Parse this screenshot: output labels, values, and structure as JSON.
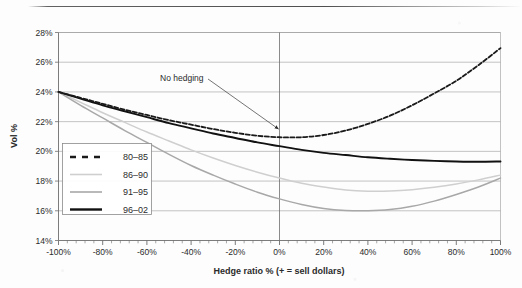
{
  "chart_data": {
    "type": "line",
    "title": "",
    "subtitle": "",
    "xlabel": "Hedge ratio % (+ = sell dollars)",
    "ylabel": "Vol %",
    "xlim": [
      -100,
      100
    ],
    "ylim": [
      14,
      28
    ],
    "grid": true,
    "legend_position": "inner-left-lower",
    "x_tick_labels": [
      "-100%",
      "-80%",
      "-60%",
      "-40%",
      "-20%",
      "0%",
      "20%",
      "40%",
      "60%",
      "80%",
      "100%"
    ],
    "x_tick_values": [
      -100,
      -80,
      -60,
      -40,
      -20,
      0,
      20,
      40,
      60,
      80,
      100
    ],
    "y_tick_labels": [
      "14%",
      "16%",
      "18%",
      "20%",
      "22%",
      "24%",
      "26%",
      "28%"
    ],
    "y_tick_values": [
      14,
      16,
      18,
      20,
      22,
      24,
      26,
      28
    ],
    "x": [
      -100,
      -90,
      -80,
      -70,
      -60,
      -50,
      -40,
      -30,
      -20,
      -10,
      0,
      10,
      20,
      30,
      40,
      50,
      60,
      70,
      80,
      90,
      100
    ],
    "series": [
      {
        "name": "80-85",
        "style": "dashed",
        "color": "#1a1a1a",
        "values": [
          24.0,
          23.6,
          23.2,
          22.8,
          22.45,
          22.1,
          21.8,
          21.5,
          21.25,
          21.05,
          20.95,
          20.95,
          21.1,
          21.4,
          21.85,
          22.4,
          23.1,
          23.9,
          24.75,
          25.8,
          26.95
        ]
      },
      {
        "name": "86-90",
        "style": "solid",
        "color": "#cfcfcf",
        "values": [
          24.0,
          23.3,
          22.6,
          21.95,
          21.3,
          20.7,
          20.1,
          19.55,
          19.05,
          18.6,
          18.2,
          17.85,
          17.6,
          17.4,
          17.32,
          17.33,
          17.42,
          17.58,
          17.8,
          18.08,
          18.4
        ]
      },
      {
        "name": "91-95",
        "style": "solid",
        "color": "#a8a8a8",
        "values": [
          24.0,
          23.1,
          22.25,
          21.4,
          20.6,
          19.8,
          19.05,
          18.4,
          17.8,
          17.25,
          16.8,
          16.42,
          16.15,
          16.02,
          16.0,
          16.08,
          16.3,
          16.65,
          17.1,
          17.6,
          18.2
        ]
      },
      {
        "name": "96-02",
        "style": "solid",
        "color": "#111111",
        "values": [
          24.0,
          23.55,
          23.1,
          22.7,
          22.3,
          21.9,
          21.55,
          21.2,
          20.9,
          20.6,
          20.35,
          20.1,
          19.9,
          19.75,
          19.6,
          19.5,
          19.42,
          19.36,
          19.32,
          19.3,
          19.32
        ]
      }
    ],
    "annotations": [
      {
        "text": "No hedging",
        "label_x": 160,
        "label_y": 81,
        "points_to_x": 0,
        "points_to_y": 21.5
      }
    ]
  },
  "legend": {
    "items": [
      {
        "label": "80-85"
      },
      {
        "label": "86-90"
      },
      {
        "label": "91-95"
      },
      {
        "label": "96-02"
      }
    ]
  }
}
